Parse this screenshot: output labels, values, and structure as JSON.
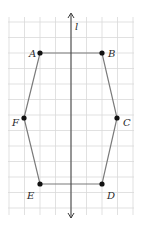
{
  "figure": {
    "axis_label": "l",
    "colors": {
      "grid": "#d9d9d9",
      "polygon": "#7a7a7a",
      "axis": "#3a3a3a",
      "point": "#111111",
      "label": "#2a2a2a"
    },
    "grid": {
      "x0": 9,
      "y0": 22,
      "step": 15.5,
      "cols": 8,
      "rows": 12
    },
    "points": [
      {
        "name": "A",
        "x": 40,
        "y": 53,
        "lx": 29,
        "ly": 53
      },
      {
        "name": "B",
        "x": 102,
        "y": 53,
        "lx": 108,
        "ly": 53
      },
      {
        "name": "C",
        "x": 117,
        "y": 118,
        "lx": 123,
        "ly": 122
      },
      {
        "name": "D",
        "x": 102,
        "y": 184,
        "lx": 107,
        "ly": 195
      },
      {
        "name": "E",
        "x": 40,
        "y": 184,
        "lx": 27,
        "ly": 195
      },
      {
        "name": "F",
        "x": 24,
        "y": 118,
        "lx": 12,
        "ly": 122
      }
    ]
  }
}
